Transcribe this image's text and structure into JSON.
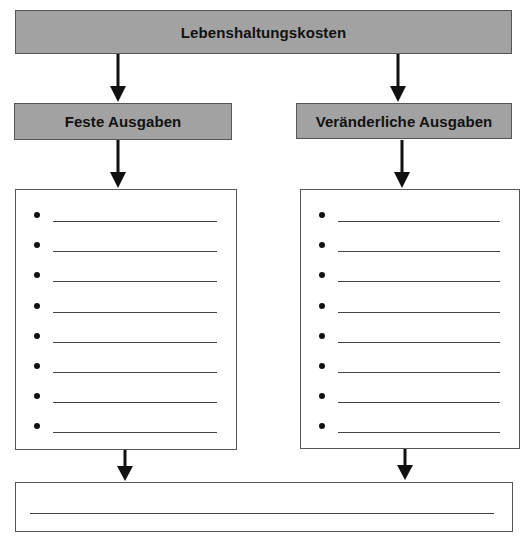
{
  "diagram": {
    "title": "Lebenshaltungskosten",
    "branches": [
      {
        "label": "Feste Ausgaben",
        "blank_lines": 8
      },
      {
        "label": "Veränderliche Ausgaben",
        "blank_lines": 8
      }
    ],
    "result_box": {
      "blank_lines": 1
    }
  },
  "colors": {
    "header_fill": "#a2a2a2",
    "border": "#555555",
    "ink": "#111111"
  }
}
